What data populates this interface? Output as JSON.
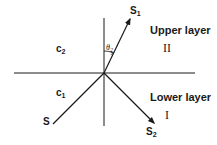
{
  "diagram": {
    "title": "",
    "labels": {
      "upper_layer": "Upper layer",
      "upper_numeral": "II",
      "lower_layer": "Lower layer",
      "lower_numeral": "I",
      "c2_base": "c",
      "c2_sub": "2",
      "c1_base": "c",
      "c1_sub": "1",
      "s_incident": "S",
      "s1_base": "S",
      "s1_sub": "1",
      "s2_base": "S",
      "s2_sub": "2",
      "theta_base": "θ",
      "theta_sub": "2"
    },
    "geometry": {
      "interface_y": 73,
      "interface_x1": 14,
      "interface_x2": 195,
      "normal_x": 104,
      "normal_y1": 18,
      "normal_y2": 126,
      "origin": [
        104,
        73
      ],
      "incident_start": [
        53,
        124
      ],
      "refracted_end": [
        130,
        18
      ],
      "reflected_end": [
        155,
        124
      ]
    },
    "colors": {
      "line": "#1a1a1a",
      "background": "#ffffff"
    }
  }
}
